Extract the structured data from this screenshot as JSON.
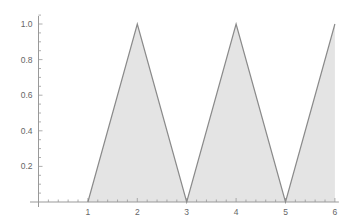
{
  "chart_data": {
    "type": "area",
    "title": "",
    "xlabel": "",
    "ylabel": "",
    "xlim": [
      0,
      6
    ],
    "ylim": [
      0,
      1.0
    ],
    "grid": false,
    "legend": null,
    "x_ticks": [
      1,
      2,
      3,
      4,
      5,
      6
    ],
    "x_tick_labels": [
      "1",
      "2",
      "3",
      "4",
      "5",
      "6"
    ],
    "y_ticks": [
      0.2,
      0.4,
      0.6,
      0.8,
      1.0
    ],
    "y_tick_labels": [
      "0.2",
      "0.4",
      "0.6",
      "0.8",
      "1.0"
    ],
    "series": [
      {
        "name": "triangle wave",
        "x": [
          1,
          2,
          3,
          4,
          5,
          6
        ],
        "y": [
          0,
          1,
          0,
          1,
          0,
          1
        ]
      }
    ],
    "fill": "to-axis",
    "colors": {
      "line": "#8a8a8a",
      "fill": "#e4e4e4",
      "axis": "#999999",
      "label": "#666666"
    }
  }
}
